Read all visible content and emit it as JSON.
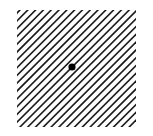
{
  "stimulus": {
    "type": "oblique-line-grating-with-fixation-dot",
    "background_color": "#ffffff",
    "line_color": "#1a1a1a",
    "dot_color": "#000000",
    "region": {
      "x": 17,
      "y": 10,
      "width": 119,
      "height": 117
    },
    "line_orientation_deg": 45,
    "line_spacing_px": 7.8,
    "line_width_px": 1.6,
    "fixation_dot": {
      "cx": 72,
      "cy": 67,
      "r": 3.6
    }
  }
}
